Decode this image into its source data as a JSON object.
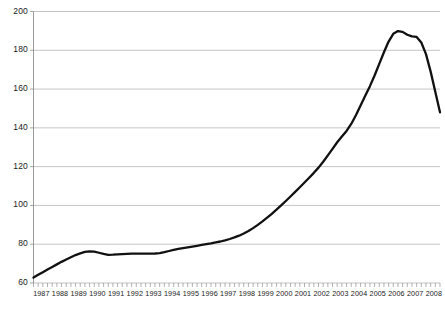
{
  "chart_data": {
    "type": "line",
    "title": "",
    "subtitle": "",
    "xlabel": "",
    "ylabel": "",
    "xlim": [
      1987,
      2008.75
    ],
    "ylim": [
      60,
      200
    ],
    "grid": "horizontal",
    "legend": null,
    "series_color": "#111111",
    "gridline_color": "#aaaaaa",
    "axis_color": "#808080",
    "background": "#ffffff",
    "ytick_labels": [
      "60",
      "80",
      "100",
      "120",
      "140",
      "160",
      "180",
      "200"
    ],
    "yticks": [
      60,
      80,
      100,
      120,
      140,
      160,
      180,
      200
    ],
    "xtick_labels": [
      "1987",
      "1988",
      "1989",
      "1990",
      "1991",
      "1992",
      "1993",
      "1994",
      "1995",
      "1996",
      "1997",
      "1998",
      "1999",
      "2000",
      "2001",
      "2002",
      "2003",
      "2004",
      "2005",
      "2006",
      "2007",
      "2008"
    ],
    "xticks": [
      1987,
      1988,
      1989,
      1990,
      1991,
      1992,
      1993,
      1994,
      1995,
      1996,
      1997,
      1998,
      1999,
      2000,
      2001,
      2002,
      2003,
      2004,
      2005,
      2006,
      2007,
      2008
    ],
    "minor_ticks_per_year": 4,
    "series": [
      {
        "name": "index",
        "x": [
          1987.0,
          1987.25,
          1987.5,
          1987.75,
          1988.0,
          1988.25,
          1988.5,
          1988.75,
          1989.0,
          1989.25,
          1989.5,
          1989.75,
          1990.0,
          1990.25,
          1990.5,
          1990.75,
          1991.0,
          1991.25,
          1991.5,
          1991.75,
          1992.0,
          1992.25,
          1992.5,
          1992.75,
          1993.0,
          1993.25,
          1993.5,
          1993.75,
          1994.0,
          1994.25,
          1994.5,
          1994.75,
          1995.0,
          1995.25,
          1995.5,
          1995.75,
          1996.0,
          1996.25,
          1996.5,
          1996.75,
          1997.0,
          1997.25,
          1997.5,
          1997.75,
          1998.0,
          1998.25,
          1998.5,
          1998.75,
          1999.0,
          1999.25,
          1999.5,
          1999.75,
          2000.0,
          2000.25,
          2000.5,
          2000.75,
          2001.0,
          2001.25,
          2001.5,
          2001.75,
          2002.0,
          2002.25,
          2002.5,
          2002.75,
          2003.0,
          2003.25,
          2003.5,
          2003.75,
          2004.0,
          2004.25,
          2004.5,
          2004.75,
          2005.0,
          2005.25,
          2005.5,
          2005.75,
          2006.0,
          2006.25,
          2006.5,
          2006.75,
          2007.0,
          2007.25,
          2007.5,
          2007.75,
          2008.0,
          2008.25,
          2008.5,
          2008.75
        ],
        "values": [
          62.8,
          64.2,
          65.6,
          67.0,
          68.3,
          69.6,
          70.9,
          72.1,
          73.3,
          74.4,
          75.3,
          76.0,
          76.3,
          76.2,
          75.6,
          75.0,
          74.5,
          74.6,
          74.8,
          74.9,
          75.0,
          75.1,
          75.1,
          75.1,
          75.1,
          75.1,
          75.2,
          75.4,
          75.9,
          76.5,
          77.1,
          77.6,
          78.0,
          78.4,
          78.8,
          79.2,
          79.6,
          80.0,
          80.4,
          80.9,
          81.4,
          82.0,
          82.7,
          83.5,
          84.4,
          85.5,
          86.8,
          88.3,
          90.0,
          91.8,
          93.7,
          95.7,
          97.8,
          100.0,
          102.3,
          104.6,
          107.0,
          109.4,
          111.8,
          114.3,
          116.8,
          119.5,
          122.5,
          125.8,
          129.2,
          132.6,
          135.5,
          138.4,
          142.0,
          146.5,
          151.5,
          156.5,
          161.5,
          167.0,
          173.0,
          179.0,
          184.5,
          188.5,
          189.9,
          189.5,
          188.0,
          187.2,
          186.9,
          184.0,
          178.0,
          169.0,
          158.5,
          148.0
        ],
        "end_value": 140.0,
        "peak_value": 190,
        "peak_year": "2006",
        "start_value": 63
      }
    ]
  },
  "axis": {
    "y_title": "",
    "x_title": ""
  }
}
